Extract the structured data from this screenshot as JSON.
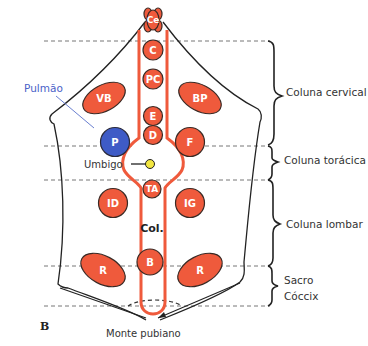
{
  "figure_label": "B",
  "colors": {
    "node_fill": "#ef5a3c",
    "node_stroke": "#3a2a25",
    "channel": "#ef5a3c",
    "lung_fill": "#3e5bc6",
    "umbilicus": "#f2e640",
    "pulmao_label": "#4a62c8",
    "outline": "#222222",
    "dashed": "#777777"
  },
  "labels": {
    "pulmao": "Pulmão",
    "umbigo": "Umbigo",
    "col": "Col.",
    "monte_pubiano": "Monte pubiano"
  },
  "regions": [
    {
      "id": "cervical",
      "label": "Coluna cervical"
    },
    {
      "id": "toracica",
      "label": "Coluna torácica"
    },
    {
      "id": "lombar",
      "label": "Coluna lombar"
    },
    {
      "id": "sacro",
      "label": "Sacro"
    },
    {
      "id": "coccix",
      "label": "Cóccix"
    }
  ],
  "nodes": {
    "ce": "Ce",
    "c": "C",
    "pc": "PC",
    "e": "E",
    "d": "D",
    "ta": "TA",
    "b": "B",
    "vb": "VB",
    "bp": "BP",
    "p": "P",
    "f": "F",
    "id": "ID",
    "ig": "IG",
    "r_left": "R",
    "r_right": "R"
  }
}
